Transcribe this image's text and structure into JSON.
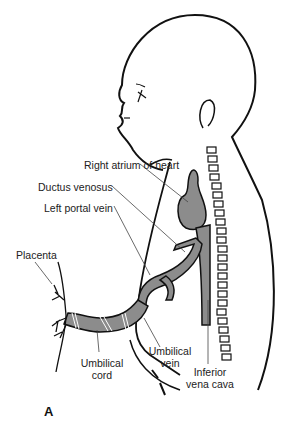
{
  "figure": {
    "panel_label": "A",
    "colors": {
      "vessel": "#8c8c8c",
      "outline": "#111111",
      "leader": "#444444",
      "background": "#ffffff"
    },
    "labels": {
      "right_atrium": "Right atrium of heart",
      "ductus_venosus": "Ductus venosus",
      "left_portal_vein": "Left portal vein",
      "placenta": "Placenta",
      "umbilical_cord_1": "Umbilical",
      "umbilical_cord_2": "cord",
      "umbilical_vein_1": "Umbilical",
      "umbilical_vein_2": "vein",
      "ivc_1": "Inferior",
      "ivc_2": "vena cava"
    }
  }
}
